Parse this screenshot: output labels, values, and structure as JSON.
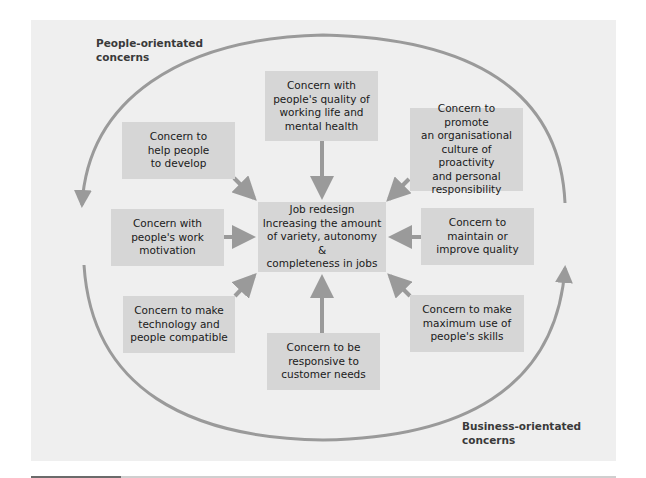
{
  "colors": {
    "panel_background": "#efefef",
    "box_fill": "#d6d6d6",
    "arrow": "#9a9a9a",
    "text": "#1a1a1a"
  },
  "labels": {
    "people_orientated": "People-orientated\nconcerns",
    "business_orientated": "Business-orientated\nconcerns"
  },
  "center": {
    "title": "Job redesign",
    "text": "Increasing the amount\nof variety, autonomy &\ncompleteness in jobs"
  },
  "concerns": {
    "quality_of_working_life": "Concern with\npeople's quality of\nworking life and\nmental health",
    "help_develop": "Concern to\nhelp people\nto develop",
    "proactivity_culture": "Concern to promote\nan organisational\nculture of proactivity\nand personal\nresponsibility",
    "work_motivation": "Concern with\npeople's work\nmotivation",
    "maintain_quality": "Concern to\nmaintain or\nimprove quality",
    "technology_compatible": "Concern to make\ntechnology and\npeople compatible",
    "customer_needs": "Concern to be\nresponsive to\ncustomer needs",
    "maximum_skills": "Concern to make\nmaximum use of\npeople's skills"
  },
  "icons": {
    "arrow": "arrow-icon",
    "cycle_arc": "cycle-arc-icon"
  }
}
